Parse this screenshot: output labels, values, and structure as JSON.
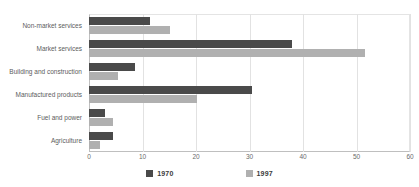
{
  "chart_data": {
    "type": "bar",
    "orientation": "horizontal",
    "title": "",
    "subtitle": "",
    "xlabel": "",
    "ylabel": "",
    "xlim": [
      0,
      60
    ],
    "xticks": [
      "0",
      "10",
      "20",
      "30",
      "40",
      "50",
      "60"
    ],
    "grid": true,
    "legend_position": "bottom",
    "categories": [
      "Non-market services",
      "Market services",
      "Building and construction",
      "Manufactured products",
      "Fuel and power",
      "Agriculture"
    ],
    "series": [
      {
        "name": "1970",
        "color": "#4a4a4a",
        "values": [
          11.4,
          38.0,
          8.6,
          30.5,
          3.0,
          4.5
        ]
      },
      {
        "name": "1997",
        "color": "#b0b0b0",
        "values": [
          15.1,
          51.6,
          5.4,
          20.2,
          4.5,
          2.1
        ]
      }
    ]
  },
  "legend": [
    {
      "label": "1970",
      "color": "#4a4a4a",
      "swatch": "legend-swatch-1970"
    },
    {
      "label": "1997",
      "color": "#b0b0b0",
      "swatch": "legend-swatch-1997"
    }
  ],
  "footnote": {
    "text": ""
  },
  "colors": {
    "series_1970": "#4a4a4a",
    "series_1997": "#b0b0b0",
    "gridline": "#e2e2e2",
    "axis": "#bfbfbf",
    "label_text": "#5c5c5c",
    "background": "#ffffff"
  }
}
